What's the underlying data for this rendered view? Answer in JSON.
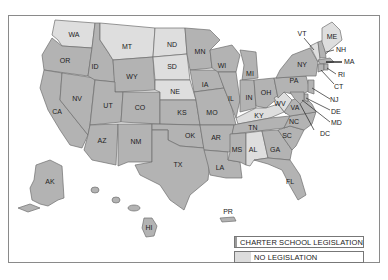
{
  "map": {
    "colors": {
      "legislation": "#b3b3b3",
      "no_legislation": "#dedede",
      "border": "#6e6e6e",
      "frame": "#8a8a8a"
    },
    "states_with_legislation": [
      "OR",
      "CA",
      "NV",
      "ID",
      "UT",
      "AZ",
      "CO",
      "NM",
      "WY",
      "TX",
      "OK",
      "KS",
      "MN",
      "IA",
      "MO",
      "AR",
      "LA",
      "WI",
      "IL",
      "MI",
      "IN",
      "OH",
      "MS",
      "TN",
      "GA",
      "FL",
      "SC",
      "NC",
      "VA",
      "PA",
      "NY",
      "NH",
      "MA",
      "RI",
      "CT",
      "NJ",
      "DE",
      "MD",
      "DC",
      "AK",
      "HI",
      "PR"
    ],
    "states_without_legislation": [
      "WA",
      "MT",
      "ND",
      "SD",
      "NE",
      "KY",
      "WV",
      "AL",
      "VT",
      "ME"
    ],
    "labels": {
      "WA": "WA",
      "OR": "OR",
      "CA": "CA",
      "NV": "NV",
      "ID": "ID",
      "MT": "MT",
      "WY": "WY",
      "UT": "UT",
      "AZ": "AZ",
      "CO": "CO",
      "NM": "NM",
      "ND": "ND",
      "SD": "SD",
      "NE": "NE",
      "KS": "KS",
      "OK": "OK",
      "TX": "TX",
      "MN": "MN",
      "IA": "IA",
      "MO": "MO",
      "AR": "AR",
      "LA": "LA",
      "WI": "WI",
      "IL": "IL",
      "MI": "MI",
      "IN": "IN",
      "OH": "OH",
      "KY": "KY",
      "TN": "TN",
      "MS": "MS",
      "AL": "AL",
      "GA": "GA",
      "FL": "FL",
      "SC": "SC",
      "NC": "NC",
      "VA": "VA",
      "WV": "WV",
      "PA": "PA",
      "NY": "NY",
      "VT": "VT",
      "ME": "ME",
      "NH": "NH",
      "MA": "MA",
      "RI": "RI",
      "CT": "CT",
      "NJ": "NJ",
      "DE": "DE",
      "MD": "MD",
      "DC": "DC",
      "AK": "AK",
      "HI": "HI",
      "PR": "PR"
    }
  },
  "legend": {
    "items": [
      {
        "label": "CHARTER SCHOOL LEGISLATION",
        "color": "#9a9a9a"
      },
      {
        "label": "NO LEGISLATION",
        "color": "#dcdcdc"
      }
    ]
  }
}
